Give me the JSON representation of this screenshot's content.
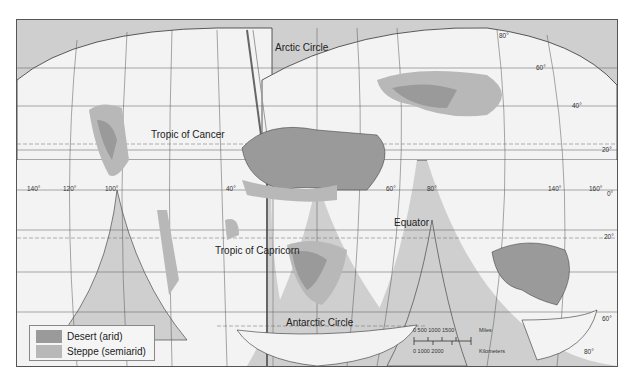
{
  "map": {
    "title": "World deserts and steppes",
    "colors": {
      "ocean_background": "#cfcfcf",
      "land_base": "#f2f2f2",
      "desert": "#9a9a9a",
      "steppe": "#b8b8b8",
      "grid": "#555555"
    },
    "labels": {
      "arctic_circle": "Arctic Circle",
      "tropic_of_cancer": "Tropic of Cancer",
      "equator": "Equator",
      "tropic_of_capricorn": "Tropic of Capricorn",
      "antarctic_circle": "Antarctic Circle"
    },
    "longitude_labels": [
      "140°",
      "120°",
      "100°",
      "40°",
      "60°",
      "80°",
      "140°",
      "160°"
    ],
    "latitude_labels": [
      "80°",
      "60°",
      "40°",
      "20°",
      "0°",
      "20°",
      "60°",
      "80°"
    ]
  },
  "legend": {
    "items": [
      {
        "label": "Desert (arid)",
        "color": "#9a9a9a"
      },
      {
        "label": "Steppe (semiarid)",
        "color": "#b8b8b8"
      }
    ]
  },
  "scale_bar": {
    "miles_ticks": "0   500  1000  1500",
    "miles_unit": "Miles",
    "km_ticks": "0     1000  2000",
    "km_unit": "Kilometers"
  }
}
